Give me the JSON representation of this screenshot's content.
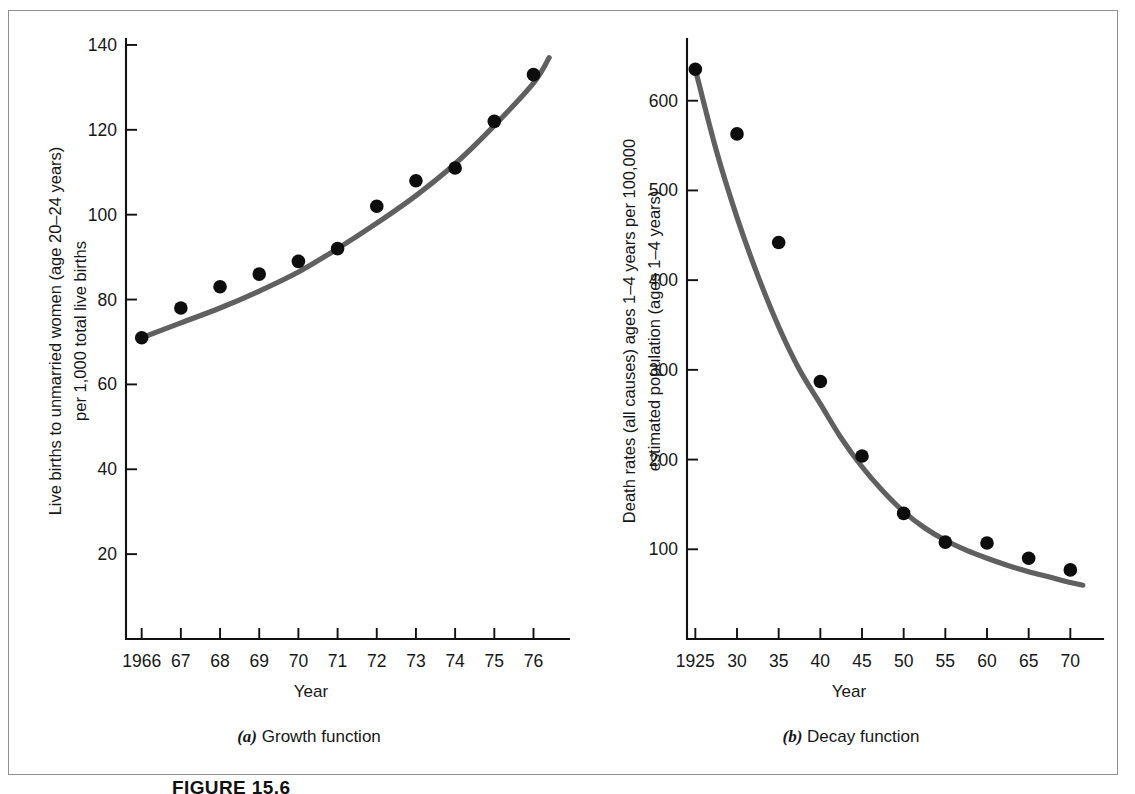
{
  "figure": {
    "number_label": "FIGURE 15.6",
    "panels": [
      {
        "caption_marker": "(a)",
        "caption_text": " Growth function"
      },
      {
        "caption_marker": "(b)",
        "caption_text": " Decay function"
      }
    ]
  },
  "chart_data": [
    {
      "type": "scatter",
      "title": "",
      "subtitle": "(a) Growth function",
      "xlabel": "Year",
      "ylabel": "Live births to unmarried women (age 20–24 years) per 1,000 total live births",
      "ylabel_line1": "Live births to unmarried women (age 20–24 years)",
      "ylabel_line2": "per 1,000 total live births",
      "x": [
        1966,
        1967,
        1968,
        1969,
        1970,
        1971,
        1972,
        1973,
        1974,
        1975,
        1976
      ],
      "xtick_labels": [
        "1966",
        "67",
        "68",
        "69",
        "70",
        "71",
        "72",
        "73",
        "74",
        "75",
        "76"
      ],
      "ytick_labels": [
        "20",
        "40",
        "60",
        "80",
        "100",
        "120",
        "140"
      ],
      "ytick_values": [
        20,
        40,
        60,
        80,
        100,
        120,
        140
      ],
      "values": [
        71,
        78,
        83,
        86,
        89,
        92,
        102,
        108,
        111,
        122,
        133
      ],
      "fit_curve_name": "exponential growth fit",
      "fit_curve_points": [
        {
          "x": 1966,
          "y": 71
        },
        {
          "x": 1967,
          "y": 74.5
        },
        {
          "x": 1968,
          "y": 78
        },
        {
          "x": 1969,
          "y": 82
        },
        {
          "x": 1970,
          "y": 86.5
        },
        {
          "x": 1971,
          "y": 92
        },
        {
          "x": 1972,
          "y": 98
        },
        {
          "x": 1973,
          "y": 104.5
        },
        {
          "x": 1974,
          "y": 112
        },
        {
          "x": 1975,
          "y": 121
        },
        {
          "x": 1976,
          "y": 131
        },
        {
          "x": 1976.4,
          "y": 137
        }
      ],
      "xlim": [
        1965.6,
        1976.6
      ],
      "ylim": [
        0,
        148
      ],
      "grid": false,
      "legend": "none",
      "marker_color": "#0d0d0d",
      "curve_color": "#606060",
      "axis_color": "#111111"
    },
    {
      "type": "scatter",
      "title": "",
      "subtitle": "(b) Decay function",
      "xlabel": "Year",
      "ylabel": "Death rates (all causes) ages 1–4 years per 100,000 estimated population (ages 1–4 years)",
      "ylabel_line1": "Death rates (all causes) ages 1–4 years per 100,000",
      "ylabel_line2": "estimated population (ages 1–4 years)",
      "x": [
        1925,
        1930,
        1935,
        1940,
        1945,
        1950,
        1955,
        1960,
        1965,
        1970
      ],
      "xtick_labels": [
        "1925",
        "30",
        "35",
        "40",
        "45",
        "50",
        "55",
        "60",
        "65",
        "70"
      ],
      "ytick_labels": [
        "100",
        "200",
        "300",
        "400",
        "500",
        "600"
      ],
      "ytick_values": [
        100,
        200,
        300,
        400,
        500,
        600
      ],
      "values": [
        635,
        563,
        442,
        287,
        204,
        140,
        108,
        107,
        90,
        77
      ],
      "fit_curve_name": "exponential decay fit",
      "fit_curve_points": [
        {
          "x": 1925,
          "y": 635
        },
        {
          "x": 1927.5,
          "y": 545
        },
        {
          "x": 1930,
          "y": 470
        },
        {
          "x": 1932.5,
          "y": 405
        },
        {
          "x": 1935,
          "y": 348
        },
        {
          "x": 1937.5,
          "y": 300
        },
        {
          "x": 1940,
          "y": 262
        },
        {
          "x": 1942.5,
          "y": 224
        },
        {
          "x": 1945,
          "y": 192
        },
        {
          "x": 1947.5,
          "y": 165
        },
        {
          "x": 1950,
          "y": 142
        },
        {
          "x": 1952.5,
          "y": 124
        },
        {
          "x": 1955,
          "y": 110
        },
        {
          "x": 1957.5,
          "y": 99
        },
        {
          "x": 1960,
          "y": 90
        },
        {
          "x": 1962.5,
          "y": 82
        },
        {
          "x": 1965,
          "y": 75
        },
        {
          "x": 1967.5,
          "y": 69
        },
        {
          "x": 1970,
          "y": 63
        },
        {
          "x": 1971.5,
          "y": 60
        }
      ],
      "xlim": [
        1924,
        1972
      ],
      "ylim": [
        0,
        700
      ],
      "grid": false,
      "legend": "none",
      "marker_color": "#0d0d0d",
      "curve_color": "#606060",
      "axis_color": "#111111"
    }
  ],
  "axis_titles": {
    "year": "Year"
  }
}
